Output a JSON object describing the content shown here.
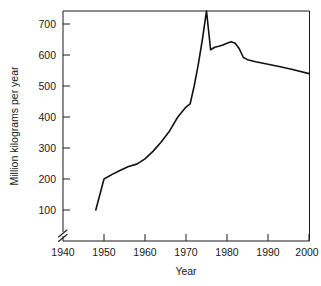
{
  "chart_data": {
    "type": "line",
    "title": "",
    "xlabel": "Year",
    "ylabel": "Million kilograms per year",
    "xlim": [
      1940,
      2000
    ],
    "ylim": [
      100,
      750
    ],
    "grid": false,
    "legend": null,
    "axis_break": {
      "axis": "y",
      "symbol": "double-slash",
      "note": "y-axis broken below 100"
    },
    "xticks": [
      1940,
      1950,
      1960,
      1970,
      1980,
      1990,
      2000
    ],
    "xtick_labels": [
      "1940",
      "1950",
      "1960",
      "1970",
      "1980",
      "1990",
      "2000"
    ],
    "yticks": [
      100,
      200,
      300,
      400,
      500,
      600,
      700
    ],
    "ytick_labels": [
      "100",
      "200",
      "300",
      "400",
      "500",
      "600",
      "700"
    ],
    "series": [
      {
        "name": "Production",
        "color": "#111111",
        "x": [
          1948,
          1950,
          1952,
          1954,
          1956,
          1958,
          1960,
          1962,
          1964,
          1966,
          1968,
          1970,
          1971,
          1972,
          1973,
          1974,
          1975,
          1976,
          1977,
          1978,
          1979,
          1980,
          1981,
          1982,
          1983,
          1984,
          1985,
          1987,
          1990,
          1993,
          1996,
          2000
        ],
        "y": [
          100,
          200,
          215,
          228,
          240,
          248,
          265,
          290,
          320,
          355,
          400,
          432,
          442,
          500,
          570,
          650,
          742,
          617,
          625,
          628,
          632,
          638,
          643,
          638,
          620,
          592,
          585,
          578,
          570,
          562,
          553,
          540
        ]
      }
    ]
  },
  "axis_labels": {
    "x_axis_title": "Year",
    "y_axis_title": "Million kilograms per year"
  },
  "colors": {
    "line": "#111111",
    "axis": "#1a1a1a",
    "background": "#ffffff"
  }
}
